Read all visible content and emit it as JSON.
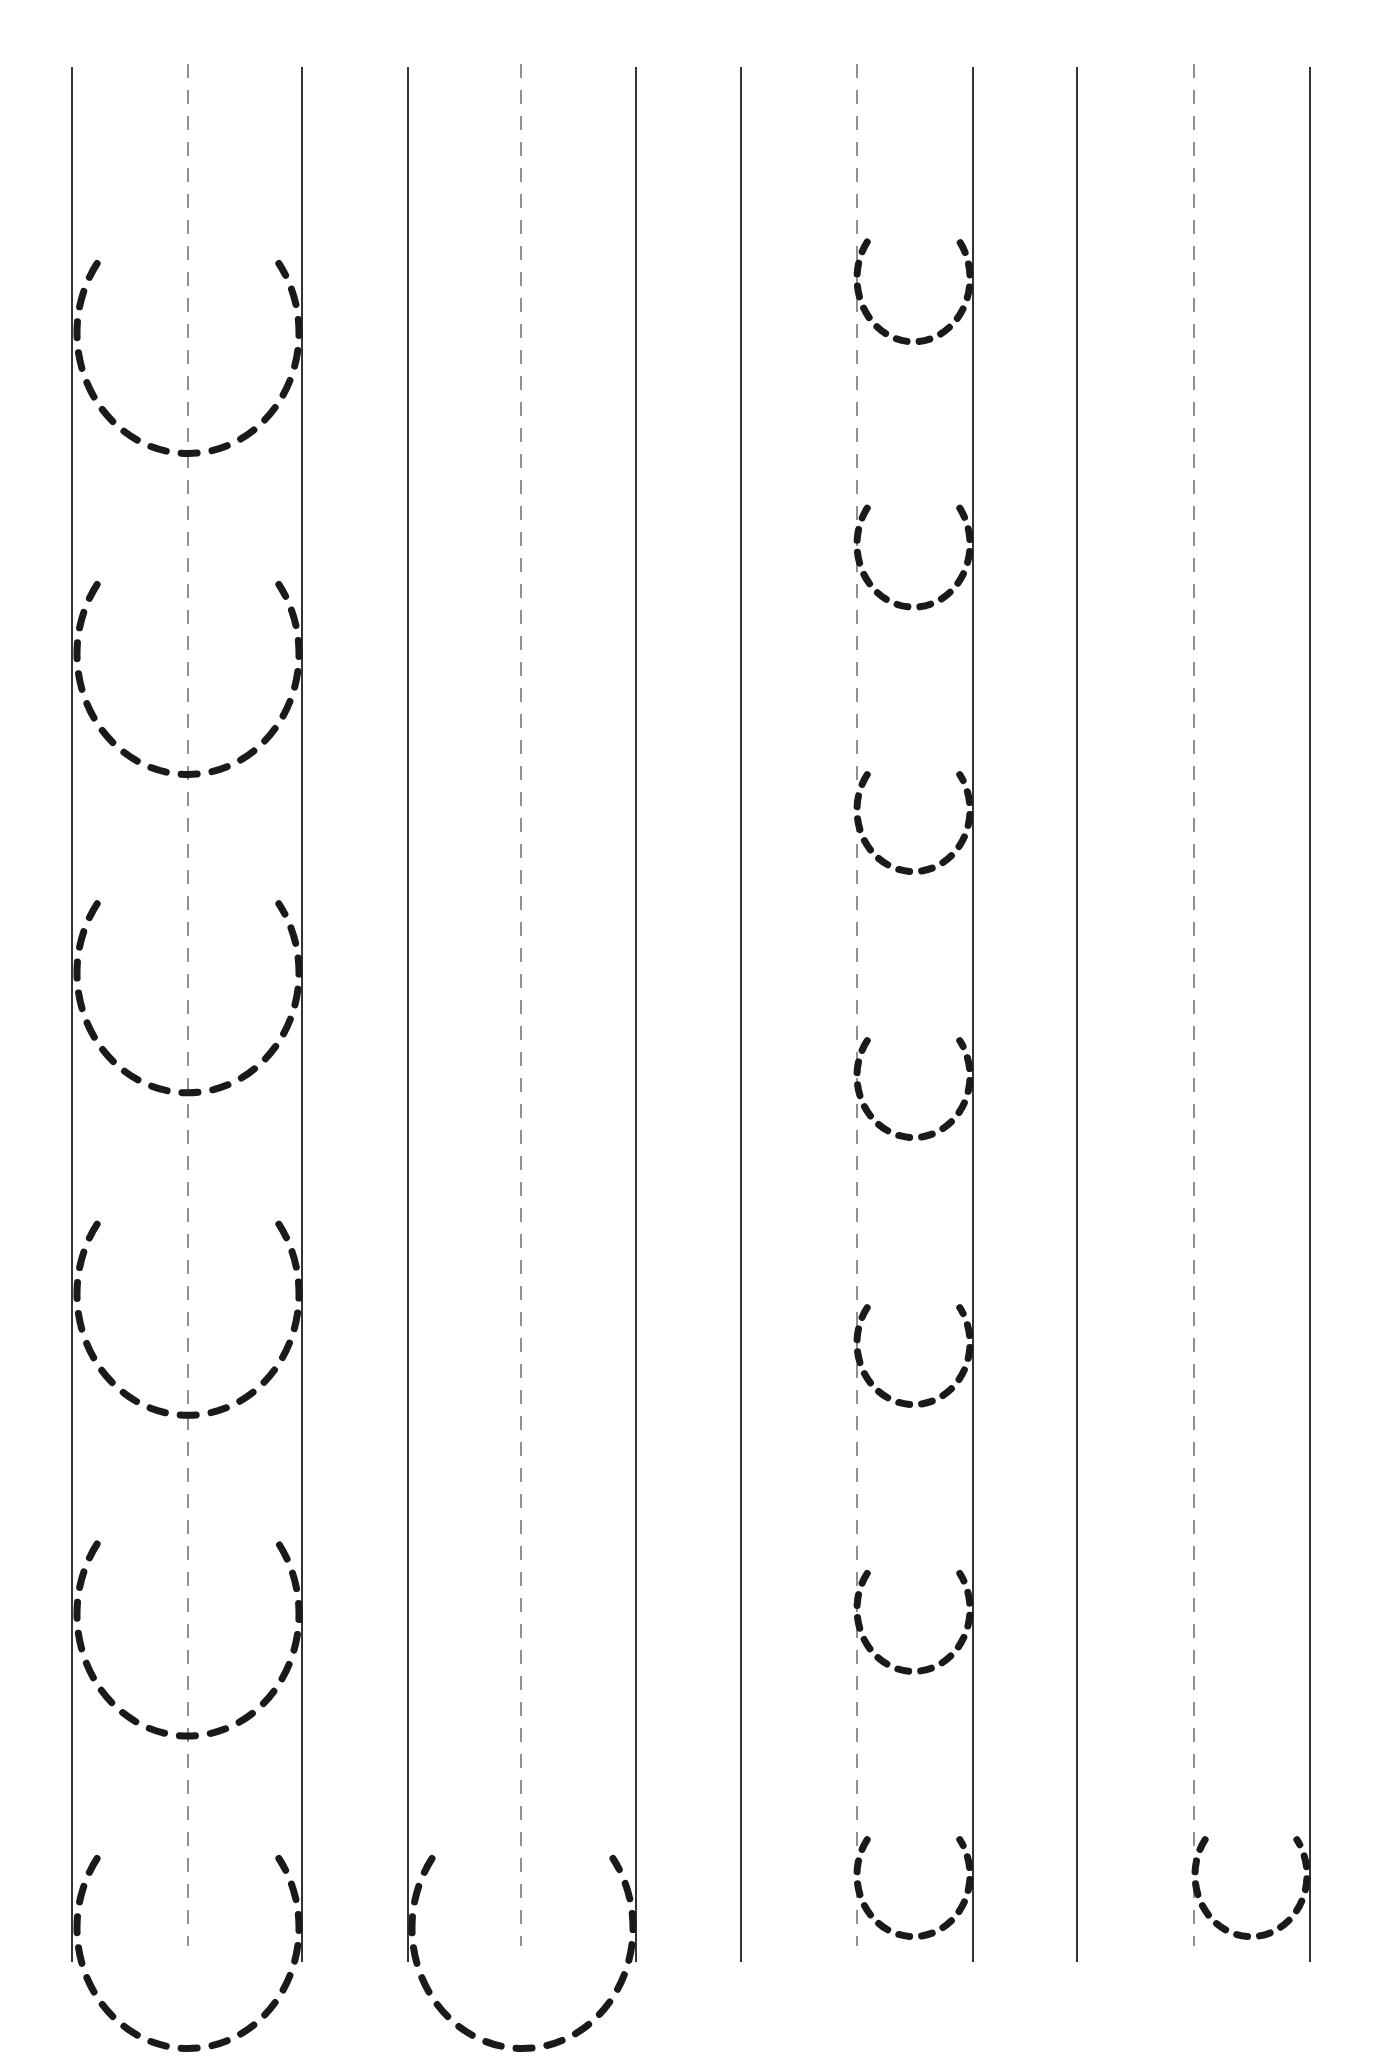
{
  "worksheet": {
    "title": "",
    "ink_color": "#1a1a1a",
    "guide_color": "#333333",
    "line_top": 67,
    "line_bottom": 1962,
    "dash_top": 64,
    "dash_bottom": 1946,
    "columns": [
      {
        "id": "col-1",
        "left": 72,
        "center": 188,
        "right": 302,
        "letter": "u-large",
        "shapes": [
          {
            "top": 125,
            "bottom": 315,
            "left": 77,
            "right": 299
          },
          {
            "top": 446,
            "bottom": 636,
            "left": 77,
            "right": 299
          },
          {
            "top": 766,
            "bottom": 955,
            "left": 77,
            "right": 299
          },
          {
            "top": 1085,
            "bottom": 1276,
            "left": 77,
            "right": 299
          },
          {
            "top": 1404,
            "bottom": 1596,
            "left": 77,
            "right": 299
          },
          {
            "top": 1720,
            "bottom": 1910,
            "left": 77,
            "right": 299
          }
        ]
      },
      {
        "id": "col-2",
        "left": 408,
        "center": 521,
        "right": 636,
        "letter": "u-large",
        "shapes": [
          {
            "top": 1720,
            "bottom": 1910,
            "left": 412,
            "right": 633
          }
        ]
      },
      {
        "id": "col-3",
        "left": 741,
        "center": 857,
        "right": 973,
        "letter": "u-small",
        "shapes": [
          {
            "top": 169,
            "bottom": 269,
            "left": 857,
            "right": 970
          },
          {
            "top": 436,
            "bottom": 535,
            "left": 857,
            "right": 970
          },
          {
            "top": 704,
            "bottom": 801,
            "left": 857,
            "right": 970
          },
          {
            "top": 970,
            "bottom": 1067,
            "left": 857,
            "right": 970
          },
          {
            "top": 1237,
            "bottom": 1334,
            "left": 857,
            "right": 970
          },
          {
            "top": 1502,
            "bottom": 1600,
            "left": 857,
            "right": 970
          },
          {
            "top": 1769,
            "bottom": 1866,
            "left": 857,
            "right": 970
          }
        ]
      },
      {
        "id": "col-4",
        "left": 1077,
        "center": 1194,
        "right": 1310,
        "letter": "u-small",
        "shapes": [
          {
            "top": 1769,
            "bottom": 1866,
            "left": 1195,
            "right": 1307
          }
        ]
      }
    ]
  }
}
